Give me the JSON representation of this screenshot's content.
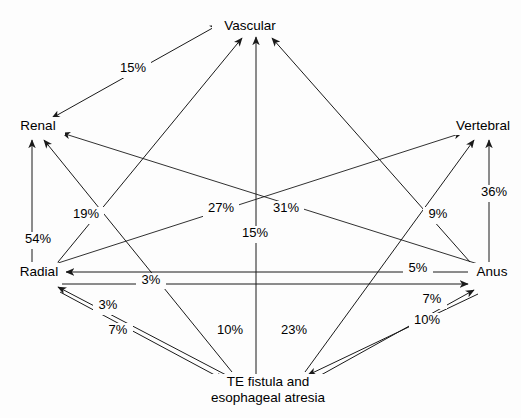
{
  "diagram": {
    "type": "directed-graph",
    "background_color": "#fdfdfd",
    "line_color": "#1a1a1a",
    "text_color": "#000000",
    "nodes": [
      {
        "id": "vascular",
        "label": "Vascular",
        "x": 250,
        "y": 26
      },
      {
        "id": "renal",
        "label": "Renal",
        "x": 38,
        "y": 126
      },
      {
        "id": "vertebral",
        "label": "Vertebral",
        "x": 483,
        "y": 126
      },
      {
        "id": "radial",
        "label": "Radial",
        "x": 39,
        "y": 272
      },
      {
        "id": "anus",
        "label": "Anus",
        "x": 492,
        "y": 272
      },
      {
        "id": "te_fistula",
        "label_line1": "TE fistula and",
        "label_line2": "esophageal atresia",
        "x": 268,
        "y": 387
      }
    ],
    "edges": [
      {
        "id": "renal-vascular",
        "from": "Renal",
        "to": "Vascular",
        "value": "15%",
        "label_x": 133,
        "label_y": 69
      },
      {
        "id": "radial-renal",
        "from": "Radial",
        "to": "Renal",
        "value": "54%",
        "label_x": 38,
        "label_y": 240
      },
      {
        "id": "tefistula-renal",
        "from": "TE fistula",
        "to": "Renal",
        "value": "19%",
        "label_x": 86,
        "label_y": 215
      },
      {
        "id": "anus-renal",
        "from": "Anus",
        "to": "Renal",
        "value": "27%",
        "label_x": 221,
        "label_y": 209
      },
      {
        "id": "radial-vertebral",
        "from": "Radial",
        "to": "Vertebral",
        "value": "31%",
        "label_x": 286,
        "label_y": 209
      },
      {
        "id": "tefistula-vascular",
        "from": "TE fistula",
        "to": "Vascular",
        "value": "15%",
        "label_x": 255,
        "label_y": 234
      },
      {
        "id": "anus-vertebral",
        "from": "Anus",
        "to": "Vertebral",
        "value": "36%",
        "label_x": 494,
        "label_y": 193
      },
      {
        "id": "tefistula-vertebral",
        "from": "TE fistula",
        "to": "Vertebral",
        "value": "9%",
        "label_x": 438,
        "label_y": 215
      },
      {
        "id": "anus-radial",
        "from": "Anus",
        "to": "Radial",
        "value": "3%",
        "label_x": 151,
        "label_y": 281
      },
      {
        "id": "radial-anus",
        "from": "Radial",
        "to": "Anus",
        "value": "5%",
        "label_x": 418,
        "label_y": 269
      },
      {
        "id": "tefistula-radial",
        "from": "TE fistula",
        "to": "Radial",
        "value": "3%",
        "label_x": 108,
        "label_y": 306
      },
      {
        "id": "radial-tefistula",
        "from": "Radial",
        "to": "TE fistula",
        "value": "7%",
        "label_x": 118,
        "label_y": 331
      },
      {
        "id": "vascular-down-left",
        "from": "Radial",
        "to": "Vascular",
        "value": "10%",
        "label_x": 230,
        "label_y": 331
      },
      {
        "id": "vascular-down-right",
        "from": "Anus",
        "to": "Vascular",
        "value": "23%",
        "label_x": 294,
        "label_y": 331
      },
      {
        "id": "tefistula-anus",
        "from": "TE fistula",
        "to": "Anus",
        "value": "7%",
        "label_x": 432,
        "label_y": 300
      },
      {
        "id": "anus-tefistula",
        "from": "Anus",
        "to": "TE fistula",
        "value": "10%",
        "label_x": 427,
        "label_y": 321
      }
    ]
  }
}
